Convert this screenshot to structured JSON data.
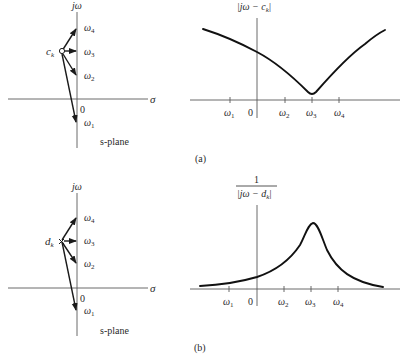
{
  "figure": {
    "panel_a": {
      "label": "(a)",
      "s_plane": {
        "vertical_axis_label": "jω",
        "horizontal_axis_label": "σ",
        "origin_label": "0",
        "plane_label": "s-plane",
        "point_symbol": "circle (zero)",
        "point_label": {
          "base": "c",
          "sub": "k"
        },
        "frequency_points": [
          {
            "base": "ω",
            "sub": "4"
          },
          {
            "base": "ω",
            "sub": "3"
          },
          {
            "base": "ω",
            "sub": "2"
          },
          {
            "base": "ω",
            "sub": "1"
          }
        ]
      },
      "magnitude_plot": {
        "ylabel": "|jω − c_k|",
        "ylabel_parts": {
          "left": "|jω − c",
          "sub": "k",
          "right": "|"
        },
        "x_ticks": [
          {
            "base": "ω",
            "sub": "1"
          },
          {
            "base": "0",
            "sub": ""
          },
          {
            "base": "ω",
            "sub": "2"
          },
          {
            "base": "ω",
            "sub": "3"
          },
          {
            "base": "ω",
            "sub": "4"
          }
        ],
        "shape": "V-shaped dip with minimum at ω3"
      }
    },
    "panel_b": {
      "label": "(b)",
      "s_plane": {
        "vertical_axis_label": "jω",
        "horizontal_axis_label": "σ",
        "origin_label": "0",
        "plane_label": "s-plane",
        "point_symbol": "cross (pole)",
        "point_label": {
          "base": "d",
          "sub": "k"
        },
        "frequency_points": [
          {
            "base": "ω",
            "sub": "4"
          },
          {
            "base": "ω",
            "sub": "3"
          },
          {
            "base": "ω",
            "sub": "2"
          },
          {
            "base": "ω",
            "sub": "1"
          }
        ]
      },
      "magnitude_plot": {
        "ylabel": "1 / |jω − d_k|",
        "ylabel_numerator": "1",
        "ylabel_parts": {
          "left": "|jω − d",
          "sub": "k",
          "right": "|"
        },
        "x_ticks": [
          {
            "base": "ω",
            "sub": "1"
          },
          {
            "base": "0",
            "sub": ""
          },
          {
            "base": "ω",
            "sub": "2"
          },
          {
            "base": "ω",
            "sub": "3"
          },
          {
            "base": "ω",
            "sub": "4"
          }
        ],
        "shape": "resonant peak at ω3"
      }
    }
  }
}
